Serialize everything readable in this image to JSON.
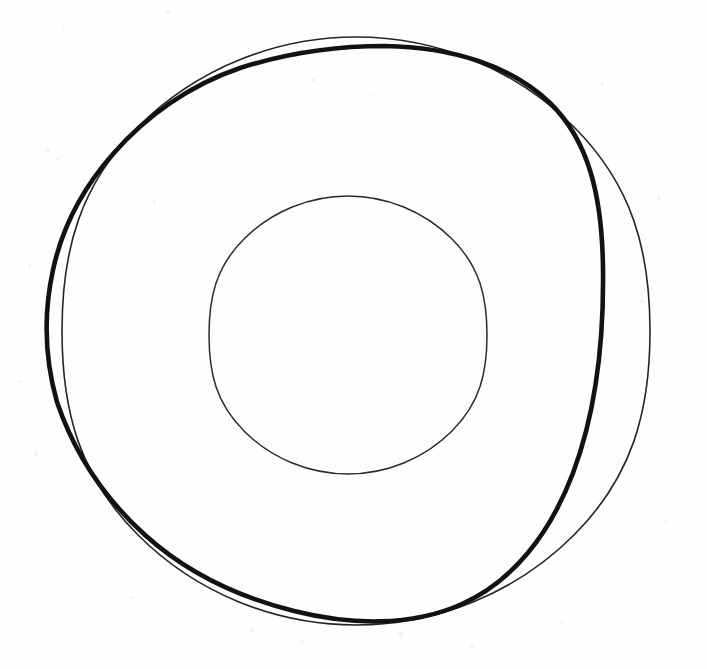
{
  "image": {
    "title": "Hand-drawn concentric circles study",
    "description": "Pencil/ink line drawing on white paper: a thin outer circle, a heavier freehand closed curve overlapping it, and a thin inner circle",
    "width": 707,
    "height": 669,
    "background_color": "#fefefe",
    "ink_color": "#1a1a1a",
    "light_ink_color": "#2b2b2b",
    "speck_color": "#f2f2f2"
  },
  "shapes": {
    "outer_thin_circle": {
      "name": "outer-thin-circle",
      "type": "circle",
      "center_x": 356,
      "center_y": 331,
      "radius": 294,
      "stroke_width": 1.6,
      "stroke_color": "#242424",
      "bbox_left": 62,
      "bbox_top": 37,
      "bbox_right": 650,
      "bbox_bottom": 625,
      "path": "M 356 37 C 437 37 516 69 574 127 C 632 185 650 250 650 331 C 650 412 632 477 574 535 C 516 593 437 625 356 625 C 275 625 196 593 138 535 C 80 477 62 412 62 331 C 62 250 80 185 138 127 C 196 69 275 37 356 37 Z"
    },
    "thick_freehand_curve": {
      "name": "thick-freehand-curve",
      "type": "closed-freehand",
      "stroke_width": 4.6,
      "stroke_color": "#121212",
      "bbox_left": 44,
      "bbox_top": 46,
      "bbox_right": 604,
      "bbox_bottom": 622,
      "path": "M 385 46 C 452 47 512 66 550 103 C 589 141 602 196 603 268 C 604 340 596 412 573 473 C 550 534 513 581 462 604 C 411 627 350 625 294 611 C 238 597 186 572 145 535 C 104 498 74 452 57 402 C 44 356 44 311 53 270 C 62 228 82 189 113 154 C 146 116 190 85 240 68 C 290 52 336 46 385 46 Z"
    },
    "inner_thin_circle": {
      "name": "inner-thin-circle",
      "type": "circle",
      "center_x": 348,
      "center_y": 335,
      "radius": 139,
      "stroke_width": 1.5,
      "stroke_color": "#2b2b2b",
      "bbox_left": 209,
      "bbox_top": 196,
      "bbox_right": 487,
      "bbox_bottom": 474,
      "path": "M 348 196 C 386 196 424 211 452 239 C 480 267 487 297 487 335 C 487 373 480 403 452 431 C 424 459 386 474 348 474 C 310 474 272 459 244 431 C 216 403 209 373 209 335 C 209 297 216 267 244 239 C 272 211 310 196 348 196 Z"
    }
  },
  "intersections": [
    {
      "name": "upper-left-crossing",
      "x": 72,
      "y": 240
    },
    {
      "name": "upper-right-crossing",
      "x": 415,
      "y": 48
    },
    {
      "name": "lower-right-crossing",
      "x": 495,
      "y": 598
    },
    {
      "name": "lower-left-crossing",
      "x": 100,
      "y": 485
    }
  ],
  "paper_specks": [
    {
      "x": 62,
      "y": 28,
      "size": 3
    },
    {
      "x": 166,
      "y": 10,
      "size": 4
    },
    {
      "x": 45,
      "y": 148,
      "size": 5
    },
    {
      "x": 56,
      "y": 157,
      "size": 4
    },
    {
      "x": 153,
      "y": 200,
      "size": 3
    },
    {
      "x": 28,
      "y": 264,
      "size": 3
    },
    {
      "x": 311,
      "y": 78,
      "size": 4
    },
    {
      "x": 372,
      "y": 94,
      "size": 3
    },
    {
      "x": 601,
      "y": 82,
      "size": 3
    },
    {
      "x": 657,
      "y": 196,
      "size": 4
    },
    {
      "x": 18,
      "y": 380,
      "size": 3
    },
    {
      "x": 34,
      "y": 452,
      "size": 4
    },
    {
      "x": 250,
      "y": 628,
      "size": 5
    },
    {
      "x": 300,
      "y": 640,
      "size": 4
    },
    {
      "x": 398,
      "y": 632,
      "size": 5
    },
    {
      "x": 470,
      "y": 645,
      "size": 4
    },
    {
      "x": 560,
      "y": 622,
      "size": 3
    },
    {
      "x": 664,
      "y": 520,
      "size": 3
    },
    {
      "x": 130,
      "y": 596,
      "size": 3
    },
    {
      "x": 640,
      "y": 300,
      "size": 3
    }
  ]
}
